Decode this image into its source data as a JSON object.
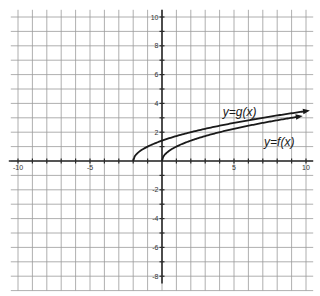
{
  "chart_data": {
    "type": "line",
    "title": "",
    "xlabel": "",
    "ylabel": "",
    "xlim": [
      -10.5,
      10.5
    ],
    "ylim": [
      -9,
      10.5
    ],
    "grid": true,
    "x_ticks": [
      -10,
      -5,
      5,
      10
    ],
    "x_tick_labels": [
      "-10",
      "-5",
      "5",
      "10"
    ],
    "y_ticks": [
      10,
      8,
      6,
      4,
      2,
      -2,
      -4,
      -6,
      -8
    ],
    "y_tick_labels": [
      "10",
      "8",
      "6",
      "4",
      "2",
      "-2",
      "-4",
      "-6",
      "-8"
    ],
    "series": [
      {
        "name": "y=g(x)",
        "expression": "sqrt(x+2)",
        "x": [
          -2,
          -1,
          0,
          1,
          2,
          4,
          6,
          8,
          10
        ],
        "values": [
          0,
          1,
          1.41,
          1.73,
          2,
          2.45,
          2.83,
          3.16,
          3.46
        ],
        "arrow_end": true
      },
      {
        "name": "y=f(x)",
        "expression": "sqrt(x)",
        "x": [
          0,
          1,
          2,
          4,
          6,
          8,
          9.5
        ],
        "values": [
          0,
          1,
          1.41,
          2,
          2.45,
          2.83,
          3.08
        ],
        "arrow_end": true
      }
    ],
    "annotations": [
      {
        "text": "y=g(x)",
        "x": 4.5,
        "y": 3.4
      },
      {
        "text": "y=f(x)",
        "x": 7.3,
        "y": 1.3
      }
    ]
  },
  "labels": {
    "g": "y=g(x)",
    "f": "y=f(x)",
    "x_ticks": [
      "-10",
      "-5",
      "5",
      "10"
    ],
    "y_ticks": [
      "10",
      "8",
      "6",
      "4",
      "2",
      "-2",
      "-4",
      "-6",
      "-8"
    ]
  }
}
